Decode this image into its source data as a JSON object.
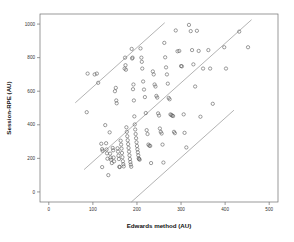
{
  "chart_data": {
    "type": "scatter",
    "title": "",
    "subtitle": "",
    "xlabel": "Edwards method (AU)",
    "ylabel": "Session-RPE (AU)",
    "xlim": [
      -20,
      520
    ],
    "ylim": [
      -60,
      1060
    ],
    "xticks": [
      0,
      100,
      200,
      300,
      400,
      500
    ],
    "yticks": [
      0,
      200,
      400,
      600,
      800,
      1000
    ],
    "xtick_labels": [
      "0",
      "100",
      "200",
      "300",
      "400",
      "500"
    ],
    "ytick_labels": [
      "0",
      "200",
      "400",
      "600",
      "800",
      "1000"
    ],
    "grid": false,
    "legend": null,
    "legend_position": "none",
    "marker": "open-circle",
    "marker_color": "#5b5b5b",
    "line_color": "#8a8a8a",
    "annotations": [],
    "reference_lines": [
      {
        "name": "upper-limit-of-agreement",
        "slope": 2.35,
        "intercept": 390,
        "x_from": 60,
        "x_to": 263
      },
      {
        "name": "mean-bias-line",
        "slope": 2.35,
        "intercept": -55,
        "x_from": 80,
        "x_to": 460
      },
      {
        "name": "lower-limit-of-agreement",
        "slope": 2.35,
        "intercept": -500,
        "x_from": 150,
        "x_to": 420
      }
    ],
    "series": [
      {
        "name": "Session-RPE vs Edwards method",
        "points": [
          [
            86,
            475
          ],
          [
            88,
            705
          ],
          [
            104,
            700
          ],
          [
            109,
            705
          ],
          [
            112,
            650
          ],
          [
            119,
            287
          ],
          [
            121,
            255
          ],
          [
            122,
            245
          ],
          [
            121,
            148
          ],
          [
            128,
            398
          ],
          [
            130,
            290
          ],
          [
            131,
            253
          ],
          [
            132,
            230
          ],
          [
            133,
            198
          ],
          [
            135,
            100
          ],
          [
            138,
            355
          ],
          [
            139,
            228
          ],
          [
            140,
            205
          ],
          [
            141,
            192
          ],
          [
            143,
            172
          ],
          [
            145,
            262
          ],
          [
            146,
            248
          ],
          [
            147,
            205
          ],
          [
            148,
            182
          ],
          [
            150,
            600
          ],
          [
            152,
            620
          ],
          [
            153,
            545
          ],
          [
            154,
            528
          ],
          [
            156,
            260
          ],
          [
            157,
            240
          ],
          [
            158,
            216
          ],
          [
            159,
            196
          ],
          [
            160,
            150
          ],
          [
            161,
            148
          ],
          [
            163,
            305
          ],
          [
            164,
            282
          ],
          [
            165,
            258
          ],
          [
            166,
            232
          ],
          [
            167,
            207
          ],
          [
            168,
            183
          ],
          [
            169,
            165
          ],
          [
            170,
            152
          ],
          [
            172,
            735
          ],
          [
            173,
            800
          ],
          [
            174,
            755
          ],
          [
            175,
            728
          ],
          [
            176,
            385
          ],
          [
            177,
            358
          ],
          [
            178,
            332
          ],
          [
            179,
            308
          ],
          [
            180,
            285
          ],
          [
            181,
            262
          ],
          [
            182,
            240
          ],
          [
            183,
            218
          ],
          [
            184,
            196
          ],
          [
            185,
            178
          ],
          [
            186,
            163
          ],
          [
            187,
            150
          ],
          [
            188,
            852
          ],
          [
            189,
            795
          ],
          [
            190,
            800
          ],
          [
            191,
            612
          ],
          [
            192,
            640
          ],
          [
            193,
            545
          ],
          [
            194,
            450
          ],
          [
            195,
            402
          ],
          [
            196,
            372
          ],
          [
            197,
            345
          ],
          [
            198,
            320
          ],
          [
            199,
            296
          ],
          [
            200,
            274
          ],
          [
            201,
            254
          ],
          [
            202,
            236
          ],
          [
            203,
            218
          ],
          [
            204,
            200
          ],
          [
            205,
            196
          ],
          [
            206,
            192
          ],
          [
            208,
            855
          ],
          [
            210,
            800
          ],
          [
            211,
            775
          ],
          [
            212,
            735
          ],
          [
            214,
            658
          ],
          [
            216,
            610
          ],
          [
            218,
            565
          ],
          [
            220,
            470
          ],
          [
            222,
            368
          ],
          [
            224,
            345
          ],
          [
            226,
            282
          ],
          [
            228,
            276
          ],
          [
            230,
            274
          ],
          [
            232,
            172
          ],
          [
            236,
            718
          ],
          [
            238,
            700
          ],
          [
            240,
            640
          ],
          [
            242,
            628
          ],
          [
            244,
            572
          ],
          [
            246,
            562
          ],
          [
            248,
            468
          ],
          [
            250,
            455
          ],
          [
            252,
            378
          ],
          [
            254,
            358
          ],
          [
            256,
            348
          ],
          [
            258,
            282
          ],
          [
            260,
            175
          ],
          [
            262,
            888
          ],
          [
            264,
            802
          ],
          [
            266,
            742
          ],
          [
            268,
            700
          ],
          [
            270,
            645
          ],
          [
            272,
            560
          ],
          [
            274,
            552
          ],
          [
            276,
            462
          ],
          [
            278,
            458
          ],
          [
            280,
            455
          ],
          [
            282,
            452
          ],
          [
            284,
            358
          ],
          [
            286,
            350
          ],
          [
            288,
            962
          ],
          [
            292,
            838
          ],
          [
            296,
            840
          ],
          [
            300,
            750
          ],
          [
            302,
            748
          ],
          [
            306,
            462
          ],
          [
            308,
            352
          ],
          [
            312,
            265
          ],
          [
            318,
            995
          ],
          [
            322,
            958
          ],
          [
            325,
            845
          ],
          [
            328,
            760
          ],
          [
            332,
            628
          ],
          [
            336,
            960
          ],
          [
            340,
            840
          ],
          [
            344,
            448
          ],
          [
            350,
            735
          ],
          [
            362,
            845
          ],
          [
            366,
            735
          ],
          [
            372,
            525
          ],
          [
            398,
            862
          ],
          [
            402,
            735
          ],
          [
            432,
            955
          ],
          [
            452,
            862
          ]
        ]
      }
    ]
  },
  "geometry": {
    "plot_left": 40,
    "plot_right": 278,
    "plot_top": 14,
    "plot_bottom": 202
  }
}
